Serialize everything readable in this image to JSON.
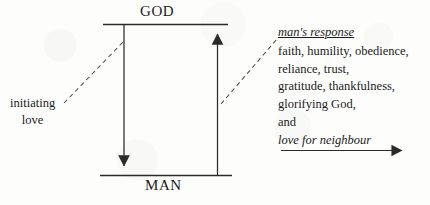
{
  "figure": {
    "type": "theological-relationship-diagram",
    "ink_color": "#2a2a2a",
    "paper_color": "#fdfdfc"
  },
  "top_label": "GOD",
  "bottom_label": "MAN",
  "left_annotation": {
    "line1": "initiating",
    "line2": "love"
  },
  "right_annotation": {
    "heading": "man's response",
    "lines": [
      "faith, humility, obedience,",
      "reliance, trust,",
      "gratitude, thankfulness,",
      "glorifying God,",
      "and"
    ],
    "italic_line": "love for neighbour"
  },
  "arrows": {
    "downward_arrow_name": "god-to-man-arrow",
    "upward_arrow_name": "man-to-god-arrow",
    "horizontal_arrow_name": "love-for-neighbour-arrow"
  }
}
